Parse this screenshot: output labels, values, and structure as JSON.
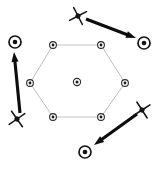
{
  "figure": {
    "width": 159,
    "height": 169,
    "background_color": "#ffffff"
  },
  "colors": {
    "lattice_edge": "#b9b9b9",
    "lattice_node_outline": "#2a2a2a",
    "lattice_node_core": "#1a1a1a",
    "free_node_outline": "#151515",
    "free_node_core": "#121212",
    "star_marker": "#141414",
    "arrow": "#0d0d0d"
  },
  "lattice": {
    "shape_name": "hexagon",
    "edge_style": "thin-light-gray",
    "center_node": {
      "label": "center-node",
      "x": 77,
      "y": 82,
      "ring_r": 3.6,
      "core_r": 1.5
    },
    "vertex_nodes": [
      {
        "label": "vertex-top-left",
        "x": 53,
        "y": 45,
        "ring_r": 3.4,
        "core_r": 1.4
      },
      {
        "label": "vertex-top-right",
        "x": 101,
        "y": 45,
        "ring_r": 3.4,
        "core_r": 1.4
      },
      {
        "label": "vertex-right",
        "x": 125,
        "y": 83,
        "ring_r": 3.4,
        "core_r": 1.4
      },
      {
        "label": "vertex-bottom-right",
        "x": 101,
        "y": 117,
        "ring_r": 3.4,
        "core_r": 1.4
      },
      {
        "label": "vertex-bottom-left",
        "x": 53,
        "y": 117,
        "ring_r": 3.4,
        "core_r": 1.4
      },
      {
        "label": "vertex-left",
        "x": 30,
        "y": 83,
        "ring_r": 3.4,
        "core_r": 1.4
      }
    ],
    "edges": [
      {
        "label": "edge-top",
        "x1": 53,
        "y1": 45,
        "x2": 101,
        "y2": 45
      },
      {
        "label": "edge-upper-right",
        "x1": 101,
        "y1": 45,
        "x2": 125,
        "y2": 83
      },
      {
        "label": "edge-lower-right",
        "x1": 125,
        "y1": 83,
        "x2": 101,
        "y2": 117
      },
      {
        "label": "edge-bottom",
        "x1": 101,
        "y1": 117,
        "x2": 53,
        "y2": 117
      },
      {
        "label": "edge-lower-left",
        "x1": 53,
        "y1": 117,
        "x2": 30,
        "y2": 83
      },
      {
        "label": "edge-upper-left",
        "x1": 30,
        "y1": 83,
        "x2": 53,
        "y2": 45
      }
    ]
  },
  "star_markers": [
    {
      "label": "star-top",
      "x": 78,
      "y": 16,
      "arm_len": 9.5,
      "hub_r": 2.6,
      "rotation": 18
    },
    {
      "label": "star-bottom-left",
      "x": 17,
      "y": 119,
      "arm_len": 9.5,
      "hub_r": 2.6,
      "rotation": 10
    },
    {
      "label": "star-bottom-right",
      "x": 142,
      "y": 110,
      "arm_len": 9.5,
      "hub_r": 2.6,
      "rotation": 12
    }
  ],
  "free_nodes": [
    {
      "label": "free-node-right",
      "x": 144,
      "y": 43,
      "ring_r": 6.0,
      "core_r": 2.3
    },
    {
      "label": "free-node-upper-left",
      "x": 15,
      "y": 42,
      "ring_r": 6.0,
      "core_r": 2.3
    },
    {
      "label": "free-node-bottom",
      "x": 85,
      "y": 152,
      "ring_r": 6.0,
      "core_r": 2.3
    }
  ],
  "arrows": [
    {
      "label": "arrow-top-to-right",
      "from_marker": "star-top",
      "to_node": "free-node-right",
      "x1": 86,
      "y1": 19,
      "x2": 136,
      "y2": 38,
      "head_len": 10,
      "head_w": 7
    },
    {
      "label": "arrow-bottom-left-to-upper-left",
      "from_marker": "star-bottom-left",
      "to_node": "free-node-upper-left",
      "x1": 20,
      "y1": 113,
      "x2": 14,
      "y2": 52,
      "head_len": 10,
      "head_w": 7
    },
    {
      "label": "arrow-bottom-right-to-bottom",
      "from_marker": "star-bottom-right",
      "to_node": "free-node-bottom",
      "x1": 137,
      "y1": 114,
      "x2": 94,
      "y2": 145,
      "head_len": 10,
      "head_w": 7
    }
  ]
}
